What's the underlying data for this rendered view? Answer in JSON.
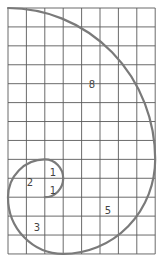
{
  "diagram": {
    "grid": {
      "columns": 8,
      "rows": 13,
      "origin_x": 8,
      "origin_y": 8,
      "cell_w": 18.4,
      "cell_h": 18.92,
      "line_color": "#5a5a5a"
    },
    "spiral_color": "#7a7a7a",
    "squares": [
      {
        "label": "1",
        "x": 53,
        "y": 176
      },
      {
        "label": "1",
        "x": 53,
        "y": 194
      },
      {
        "label": "2",
        "x": 30,
        "y": 186
      },
      {
        "label": "3",
        "x": 37,
        "y": 231
      },
      {
        "label": "5",
        "x": 108,
        "y": 214
      },
      {
        "label": "8",
        "x": 92,
        "y": 88
      }
    ]
  }
}
